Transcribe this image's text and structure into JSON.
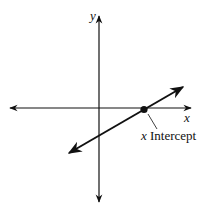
{
  "diagram": {
    "title": "",
    "axes": {
      "x_label": "x",
      "y_label": "y"
    },
    "annotation": {
      "variable": "x",
      "text": "Intercept"
    },
    "colors": {
      "stroke": "#111111",
      "background": "#ffffff"
    },
    "line": {
      "from": [
        68,
        154
      ],
      "to": [
        184,
        86
      ],
      "intercept_point": [
        144,
        110
      ]
    }
  }
}
